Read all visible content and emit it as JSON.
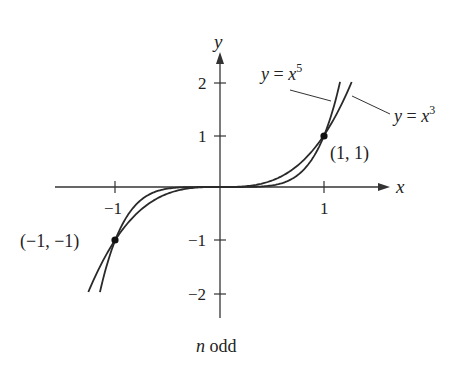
{
  "chart_data": {
    "type": "line",
    "title": "",
    "caption": "n odd",
    "caption_var": "n",
    "caption_rest": " odd",
    "xlabel": "x",
    "ylabel": "y",
    "xlim": [
      -1.58,
      1.72
    ],
    "ylim": [
      -2.2,
      2.5
    ],
    "grid": false,
    "legend": "inline annotations",
    "x_ticks": [
      {
        "value": -1,
        "label": "−1"
      },
      {
        "value": 1,
        "label": "1"
      }
    ],
    "y_ticks": [
      {
        "value": 2,
        "label": "2"
      },
      {
        "value": 1,
        "label": "1"
      },
      {
        "value": -1,
        "label": "−1"
      },
      {
        "value": -2,
        "label": "−2"
      }
    ],
    "series": [
      {
        "name": "y = x^3",
        "exponent": 3,
        "x_range": [
          -1.26,
          1.26
        ],
        "label_prefix": "y = x",
        "label_sup": "3"
      },
      {
        "name": "y = x^5",
        "exponent": 5,
        "x_range": [
          -1.149,
          1.149
        ],
        "label_prefix": "y = x",
        "label_sup": "5"
      }
    ],
    "points": [
      {
        "x": 1,
        "y": 1,
        "label": "(1, 1)"
      },
      {
        "x": -1,
        "y": -1,
        "label": "(−1, −1)"
      }
    ],
    "colors": {
      "curve": "#2a2a2a",
      "axis": "#333333",
      "text": "#222222",
      "background": "#ffffff"
    }
  }
}
